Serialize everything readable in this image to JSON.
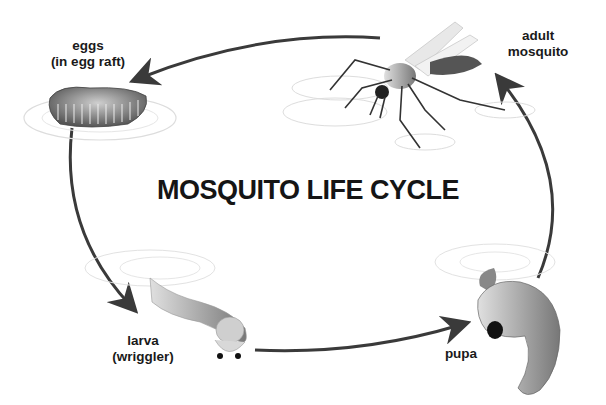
{
  "title": "MOSQUITO LIFE CYCLE",
  "stages": [
    {
      "id": "eggs",
      "line1": "eggs",
      "line2": "(in egg raft)"
    },
    {
      "id": "larva",
      "line1": "larva",
      "line2": "(wriggler)"
    },
    {
      "id": "pupa",
      "line1": "pupa",
      "line2": ""
    },
    {
      "id": "adult",
      "line1": "adult",
      "line2": "mosquito"
    }
  ],
  "cycle_order": [
    "eggs",
    "larva",
    "pupa",
    "adult",
    "eggs"
  ],
  "colors": {
    "arrow": "#3a3a3a",
    "text": "#1a1a1a",
    "background": "#ffffff"
  }
}
